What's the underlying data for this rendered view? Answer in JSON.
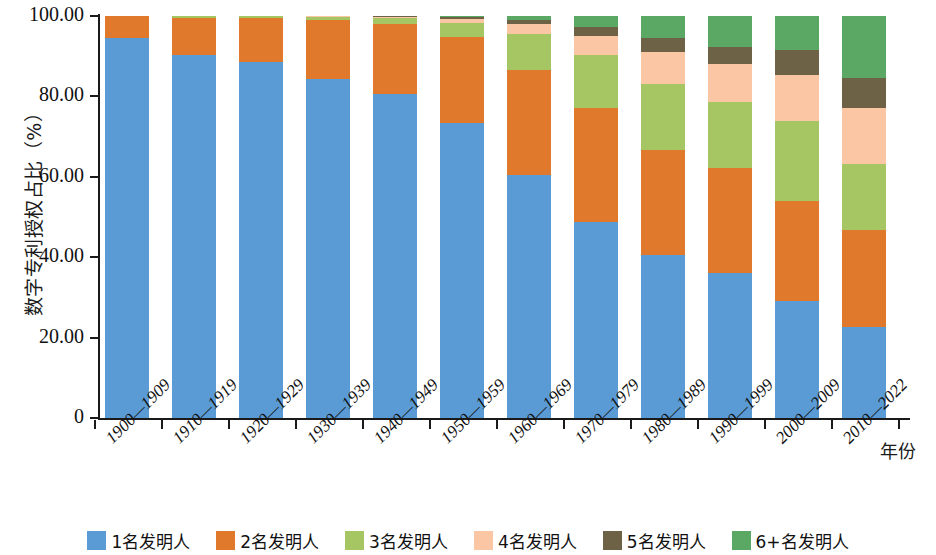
{
  "chart_data": {
    "type": "bar",
    "stacked": true,
    "stack_mode": "percent",
    "title": "",
    "xlabel": "年份",
    "ylabel": "数字专利授权占比（%）",
    "ylim": [
      0,
      100
    ],
    "ytick_labels": [
      "0",
      "20.00",
      "40.00",
      "60.00",
      "80.00",
      "100.00"
    ],
    "ytick_values": [
      0,
      20,
      40,
      60,
      80,
      100
    ],
    "grid": false,
    "legend_position": "bottom",
    "categories": [
      "1900—1909",
      "1910—1919",
      "1920—1929",
      "1930—1939",
      "1940—1949",
      "1950—1959",
      "1960—1969",
      "1970—1979",
      "1980—1989",
      "1990—1999",
      "2000—2009",
      "2010—2022"
    ],
    "series": [
      {
        "name": "1名发明人",
        "color": "#5B9BD5",
        "values": [
          94.5,
          90.2,
          88.6,
          84.3,
          80.6,
          73.4,
          60.4,
          48.8,
          40.6,
          36.0,
          29.1,
          22.6
        ]
      },
      {
        "name": "2名发明人",
        "color": "#E0792B",
        "values": [
          5.5,
          9.3,
          10.9,
          14.7,
          17.4,
          21.3,
          26.1,
          28.3,
          26.1,
          26.2,
          24.8,
          24.2
        ]
      },
      {
        "name": "3名发明人",
        "color": "#A5C663",
        "values": [
          0.0,
          0.5,
          0.5,
          0.8,
          1.5,
          3.6,
          9.1,
          13.3,
          16.5,
          16.4,
          19.9,
          16.5
        ]
      },
      {
        "name": "4名发明人",
        "color": "#FBC6A4",
        "values": [
          0.0,
          0.0,
          0.0,
          0.2,
          0.3,
          1.0,
          2.4,
          4.7,
          7.8,
          9.5,
          11.5,
          13.7
        ]
      },
      {
        "name": "5名发明人",
        "color": "#6E6246",
        "values": [
          0.0,
          0.0,
          0.0,
          0.0,
          0.2,
          0.4,
          0.9,
          2.1,
          3.6,
          4.2,
          6.3,
          7.5
        ]
      },
      {
        "name": "6+名发明人",
        "color": "#5BA864",
        "values": [
          0.0,
          0.0,
          0.0,
          0.0,
          0.0,
          0.3,
          1.1,
          2.8,
          5.4,
          7.7,
          8.4,
          15.5
        ]
      }
    ]
  },
  "axes": {
    "y_title": "数字专利授权占比（%）",
    "x_title": "年份"
  }
}
